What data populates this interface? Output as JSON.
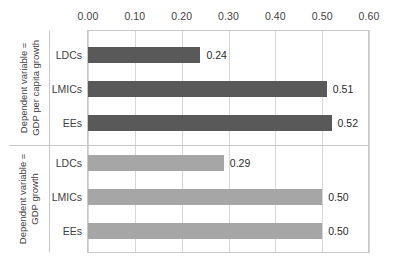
{
  "chart_data": {
    "type": "bar",
    "orientation": "horizontal",
    "title": "",
    "subtitle": "",
    "xlabel": "",
    "ylabel": "",
    "xlim": [
      0.0,
      0.6
    ],
    "xticks": [
      "0.00",
      "0.10",
      "0.20",
      "0.30",
      "0.40",
      "0.50",
      "0.60"
    ],
    "xtick_values": [
      0.0,
      0.1,
      0.2,
      0.3,
      0.4,
      0.5,
      0.6
    ],
    "grid": true,
    "grid_axis": "x",
    "axis_position": "top",
    "legend": "none",
    "categories": [
      "LDCs",
      "LMICs",
      "EEs"
    ],
    "groups": [
      {
        "name": "Dependent variable = GDP per capita growth",
        "label_lines": [
          "Dependent variable =",
          "GDP per capita growth"
        ],
        "color": "#595959",
        "bars": [
          {
            "category": "LDCs",
            "value": 0.24,
            "label": "0.24"
          },
          {
            "category": "LMICs",
            "value": 0.51,
            "label": "0.51"
          },
          {
            "category": "EEs",
            "value": 0.52,
            "label": "0.52"
          }
        ]
      },
      {
        "name": "Dependent variable = GDP growth",
        "label_lines": [
          "Dependent variable =",
          "GDP growth"
        ],
        "color": "#a6a6a6",
        "bars": [
          {
            "category": "LDCs",
            "value": 0.29,
            "label": "0.29"
          },
          {
            "category": "LMICs",
            "value": 0.5,
            "label": "0.50"
          },
          {
            "category": "EEs",
            "value": 0.5,
            "label": "0.50"
          }
        ]
      }
    ],
    "colors": {
      "dark_series": "#595959",
      "light_series": "#a6a6a6",
      "gridline": "#d6d6d6",
      "border": "#c8c8c8",
      "text": "#3f3f3f",
      "background": "#ffffff"
    }
  },
  "geometry": {
    "x_origin_px": 88,
    "x_span_px": 281,
    "plot_top_px": 30,
    "plot_height_px": 223,
    "bar_height_px": 16,
    "row_centers_px": [
      55,
      89,
      123,
      163,
      197,
      231
    ],
    "divider_y_px": 145
  }
}
